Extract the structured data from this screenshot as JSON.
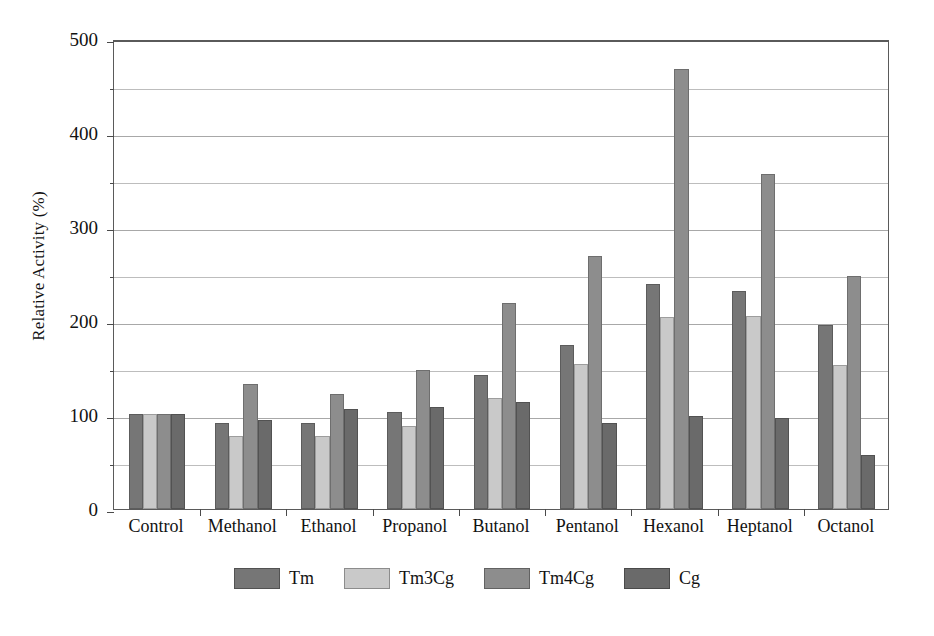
{
  "chart_data": {
    "type": "bar",
    "title": "",
    "xlabel": "",
    "ylabel": "Relative Activity (%)",
    "ylim": [
      0,
      500
    ],
    "y_ticks_major": [
      0,
      100,
      200,
      300,
      400,
      500
    ],
    "y_ticks_minor": [
      50,
      150,
      250,
      350,
      450
    ],
    "grid": true,
    "legend_position": "bottom",
    "categories": [
      "Control",
      "Methanol",
      "Ethanol",
      "Propanol",
      "Butanol",
      "Pentanol",
      "Hexanol",
      "Heptanol",
      "Octanol"
    ],
    "series": [
      {
        "name": "Tm",
        "color": "#767676",
        "values": [
          101,
          92,
          92,
          103,
          143,
          174,
          239,
          232,
          196
        ]
      },
      {
        "name": "Tm3Cg",
        "color": "#c9c9c9",
        "values": [
          101,
          78,
          78,
          88,
          118,
          154,
          204,
          205,
          153
        ]
      },
      {
        "name": "Tm4Cg",
        "color": "#8d8d8d",
        "values": [
          101,
          133,
          122,
          148,
          219,
          269,
          468,
          356,
          248
        ]
      },
      {
        "name": "Cg",
        "color": "#6a6a6a",
        "values": [
          101,
          95,
          106,
          109,
          114,
          92,
          99,
          97,
          57
        ]
      }
    ]
  },
  "legend": {
    "items": [
      {
        "label": "Tm",
        "color": "#767676"
      },
      {
        "label": "Tm3Cg",
        "color": "#c9c9c9"
      },
      {
        "label": "Tm4Cg",
        "color": "#8d8d8d"
      },
      {
        "label": "Cg",
        "color": "#6a6a6a"
      }
    ]
  },
  "axes": {
    "y_title": "Relative Activity (%)",
    "y_tick_labels": [
      "0",
      "100",
      "200",
      "300",
      "400",
      "500"
    ]
  }
}
